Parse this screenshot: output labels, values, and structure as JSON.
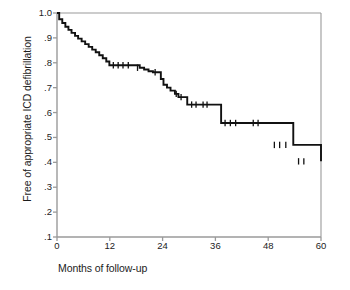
{
  "chart_data": {
    "type": "line",
    "subtype": "kaplan-meier-step",
    "title": "",
    "xlabel": "Months of follow-up",
    "ylabel": "Free of appropriate ICD defibrillation",
    "xlim": [
      0,
      60
    ],
    "ylim": [
      0.1,
      1.0
    ],
    "xticks": [
      0,
      12,
      24,
      36,
      48,
      60
    ],
    "xtick_labels": [
      "0",
      "12",
      "24",
      "36",
      "48",
      "60"
    ],
    "yticks": [
      0.1,
      0.2,
      0.3,
      0.4,
      0.5,
      0.6,
      0.7,
      0.8,
      0.9,
      1.0
    ],
    "ytick_labels": [
      ".1",
      ".2",
      ".3",
      ".4",
      ".5",
      ".6",
      ".7",
      ".8",
      ".9",
      "1.0"
    ],
    "grid": false,
    "legend": null,
    "line_color": "#111111",
    "axis_color": "#9a9a9a",
    "background": "#ffffff",
    "series": [
      {
        "name": "Free of appropriate ICD defibrillation",
        "step": "post",
        "x": [
          0.0,
          0.5,
          1.2,
          1.9,
          2.6,
          3.3,
          4.1,
          4.8,
          5.6,
          6.4,
          7.2,
          8.0,
          8.8,
          9.6,
          10.4,
          11.2,
          11.9,
          17.8,
          18.8,
          19.8,
          20.8,
          21.8,
          23.0,
          23.6,
          24.2,
          25.0,
          25.8,
          26.8,
          27.6,
          29.6,
          36.0,
          37.3,
          48.0,
          53.7,
          60.0
        ],
        "y": [
          1.0,
          0.975,
          0.96,
          0.945,
          0.932,
          0.92,
          0.908,
          0.897,
          0.886,
          0.875,
          0.864,
          0.853,
          0.842,
          0.83,
          0.818,
          0.805,
          0.79,
          0.79,
          0.78,
          0.773,
          0.766,
          0.762,
          0.762,
          0.735,
          0.712,
          0.7,
          0.688,
          0.675,
          0.662,
          0.632,
          0.632,
          0.558,
          0.558,
          0.47,
          0.404
        ]
      }
    ],
    "censor_marks": [
      {
        "x": 12.8,
        "y": 0.79
      },
      {
        "x": 13.9,
        "y": 0.79
      },
      {
        "x": 15.0,
        "y": 0.79
      },
      {
        "x": 16.2,
        "y": 0.79
      },
      {
        "x": 18.3,
        "y": 0.78
      },
      {
        "x": 22.3,
        "y": 0.762
      },
      {
        "x": 27.1,
        "y": 0.675
      },
      {
        "x": 28.2,
        "y": 0.662
      },
      {
        "x": 30.6,
        "y": 0.632
      },
      {
        "x": 31.6,
        "y": 0.632
      },
      {
        "x": 33.2,
        "y": 0.632
      },
      {
        "x": 34.1,
        "y": 0.632
      },
      {
        "x": 38.2,
        "y": 0.558
      },
      {
        "x": 39.4,
        "y": 0.558
      },
      {
        "x": 40.6,
        "y": 0.558
      },
      {
        "x": 44.6,
        "y": 0.558
      },
      {
        "x": 45.7,
        "y": 0.558
      },
      {
        "x": 49.4,
        "y": 0.47
      },
      {
        "x": 50.6,
        "y": 0.47
      },
      {
        "x": 52.0,
        "y": 0.47
      },
      {
        "x": 54.9,
        "y": 0.404
      },
      {
        "x": 56.1,
        "y": 0.404
      }
    ]
  }
}
